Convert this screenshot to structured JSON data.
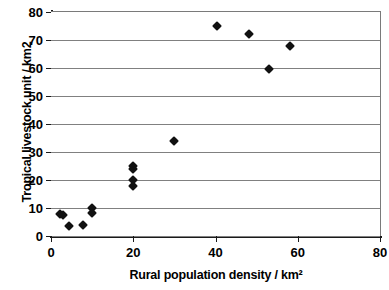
{
  "chart_data": {
    "type": "scatter",
    "title": "",
    "xlabel": "Rural population density / km²",
    "ylabel": "Tropical livestock unit / km2",
    "xlim": [
      0,
      80
    ],
    "ylim": [
      0,
      80
    ],
    "xticks": [
      0,
      20,
      40,
      60,
      80
    ],
    "yticks": [
      0,
      10,
      20,
      30,
      40,
      50,
      60,
      70,
      80
    ],
    "xtick_labels": [
      "0",
      "20",
      "40",
      "60",
      "80"
    ],
    "ytick_labels": [
      "0",
      "10",
      "20",
      "30",
      "40",
      "50",
      "60",
      "70",
      "80"
    ],
    "grid": "horizontal",
    "legend": "none",
    "marker": "diamond",
    "marker_color": "#111111",
    "gridline_color": "#808080",
    "axis_color": "#1a1a1a",
    "background_color": "#ffffff",
    "series": [
      {
        "name": "observations",
        "points": [
          {
            "x": 2.2,
            "y": 8.0
          },
          {
            "x": 3.0,
            "y": 7.4
          },
          {
            "x": 4.3,
            "y": 3.4
          },
          {
            "x": 7.8,
            "y": 4.0
          },
          {
            "x": 10.0,
            "y": 10.0
          },
          {
            "x": 10.0,
            "y": 8.2
          },
          {
            "x": 20.0,
            "y": 25.0
          },
          {
            "x": 20.0,
            "y": 23.8
          },
          {
            "x": 20.0,
            "y": 20.0
          },
          {
            "x": 20.0,
            "y": 18.0
          },
          {
            "x": 30.0,
            "y": 34.0
          },
          {
            "x": 40.3,
            "y": 75.0
          },
          {
            "x": 48.2,
            "y": 72.0
          },
          {
            "x": 53.0,
            "y": 59.8
          },
          {
            "x": 58.2,
            "y": 68.0
          }
        ]
      }
    ]
  }
}
